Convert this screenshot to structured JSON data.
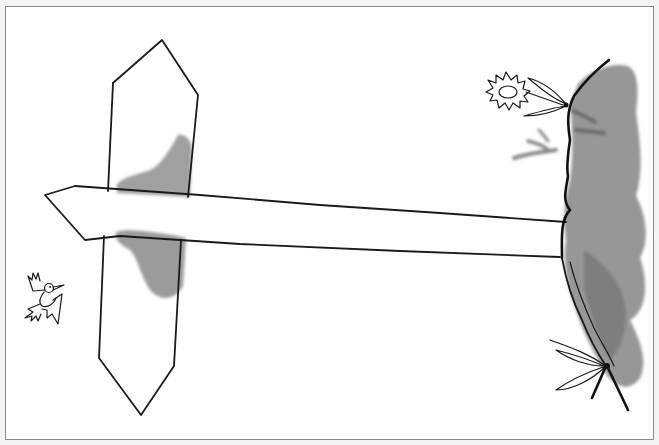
{
  "illustration": {
    "description": "Ink and watercolor drawing of a signpost with an arrow pointing left toward a small bird, and a grey bush with a daisy on the right",
    "colors": {
      "paper": "#ffffff",
      "border": "#8a8a8a",
      "ink": "#1a1a1a",
      "wash_light": "#9a9a9a",
      "wash_dark": "#6e6e6e"
    },
    "elements": {
      "signpost": "tall hexagonal post with pointed top and bottom",
      "arrow": "long horizontal arrow sign pointing left",
      "post_shadow": "grey watercolor wash behind post",
      "bush": "grey watercolor bush on right edge",
      "daisy": "small outlined daisy with leaves",
      "bird": "small line-drawn bird flying",
      "grass_marks": "grey brush strokes"
    }
  }
}
